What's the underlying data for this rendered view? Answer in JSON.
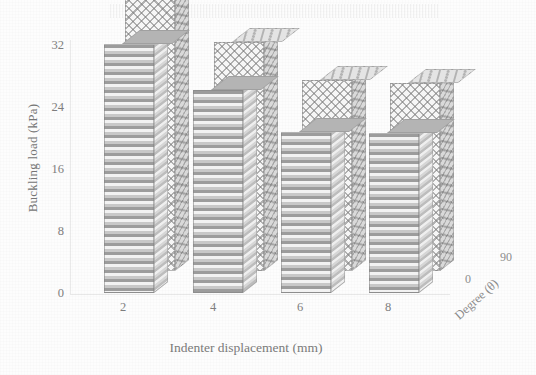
{
  "chart_data": {
    "type": "bar",
    "title": "",
    "subtitle": "",
    "style": "3d-grouped-bar",
    "xlabel": "Indenter displacement (mm)",
    "ylabel": "Buckling load (kPa)",
    "zlabel": "Degree (θ)",
    "categories": [
      "2",
      "4",
      "6",
      "8"
    ],
    "ylim": [
      0,
      32
    ],
    "yticks": [
      "0",
      "8",
      "16",
      "24",
      "32"
    ],
    "ytick_values": [
      0,
      8,
      16,
      24,
      32
    ],
    "zticks": [
      "0",
      "90"
    ],
    "grid": false,
    "legend": "none",
    "series": [
      {
        "name": "0",
        "depth_index": 0,
        "pattern": "horizontal-stripes",
        "values": [
          32.1,
          26.2,
          20.8,
          20.6
        ]
      },
      {
        "name": "90",
        "depth_index": 1,
        "pattern": "cross-hatch",
        "values": [
          35.7,
          29.5,
          24.6,
          24.3
        ]
      }
    ]
  },
  "axes": {
    "y_title": "Buckling load (kPa)",
    "x_title": "Indenter displacement (mm)",
    "z_title": "Degree (θ)",
    "y_ticks": [
      "32",
      "24",
      "16",
      "8",
      "0"
    ],
    "x_ticks": [
      "2",
      "4",
      "6",
      "8"
    ],
    "z_ticks": [
      "0",
      "90"
    ]
  },
  "colors": {
    "ink": "#7a7a7a",
    "bar_stripe_dark": "#9c9c9c",
    "bar_stripe_light": "#f2f2f2",
    "bar_hatch": "#787878",
    "background": "#ffffff"
  }
}
